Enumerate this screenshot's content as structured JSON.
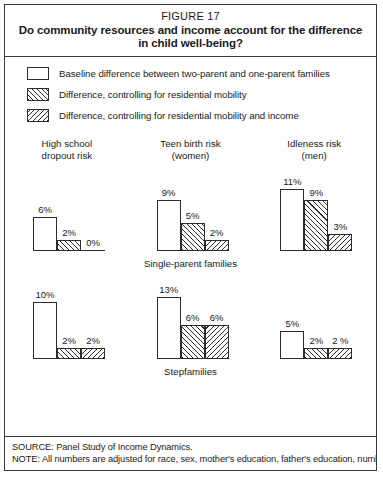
{
  "figure": {
    "number": "FIGURE 17",
    "title_line1": "Do community resources and income account for the difference",
    "title_line2": "in child well-being?"
  },
  "legend": {
    "items": [
      {
        "pattern": "plain",
        "label": "Baseline difference between two-parent and one-parent families"
      },
      {
        "pattern": "forward-hatch",
        "label": "Difference, controlling for residential mobility"
      },
      {
        "pattern": "back-hatch",
        "label": "Difference, controlling for residential mobility and income"
      }
    ]
  },
  "columns": [
    {
      "line1": "High school",
      "line2": "dropout risk"
    },
    {
      "line1": "Teen birth risk",
      "line2": "(women)"
    },
    {
      "line1": "Idleness risk",
      "line2": "(men)"
    }
  ],
  "rows": [
    {
      "group_label": "Single-parent families",
      "label_column": 1
    },
    {
      "group_label": "Stepfamilies",
      "label_column": 1
    }
  ],
  "footnotes": {
    "source": "SOURCE: Panel Study of Income Dynamics.",
    "note": "NOTE: All numbers are adjusted for race, sex, mother's education, father's education, number"
  },
  "colors": {
    "ink": "#1a1a1a",
    "border": "#3a3a3a",
    "bar_outline": "#2b2b2b",
    "background": "#ffffff"
  },
  "chart_data": {
    "type": "bar",
    "title": "Do community resources and income account for the difference in child well-being?",
    "xlabel": "",
    "ylabel": "Percentage-point difference in risk",
    "ylim": [
      0,
      13
    ],
    "grid": false,
    "legend_position": "top",
    "units": "%",
    "series": [
      {
        "name": "Baseline difference between two-parent and one-parent families",
        "pattern": "plain"
      },
      {
        "name": "Difference, controlling for residential mobility",
        "pattern": "forward-hatch"
      },
      {
        "name": "Difference, controlling for residential mobility and income",
        "pattern": "back-hatch"
      }
    ],
    "panels": [
      {
        "family_type": "Single-parent families",
        "groups": [
          {
            "category": "High school dropout risk",
            "values": [
              6,
              2,
              0
            ],
            "labels": [
              "6%",
              "2%",
              "0%"
            ]
          },
          {
            "category": "Teen birth risk (women)",
            "values": [
              9,
              5,
              2
            ],
            "labels": [
              "9%",
              "5%",
              "2%"
            ]
          },
          {
            "category": "Idleness risk (men)",
            "values": [
              11,
              9,
              3
            ],
            "labels": [
              "11%",
              "9%",
              "3%"
            ]
          }
        ]
      },
      {
        "family_type": "Stepfamilies",
        "groups": [
          {
            "category": "High school dropout risk",
            "values": [
              10,
              2,
              2
            ],
            "labels": [
              "10%",
              "2%",
              "2%"
            ]
          },
          {
            "category": "Teen birth risk (women)",
            "values": [
              13,
              6,
              6
            ],
            "labels": [
              "13%",
              "6%",
              "6%"
            ]
          },
          {
            "category": "Idleness risk (men)",
            "values": [
              5,
              2,
              2
            ],
            "labels": [
              "5%",
              "2%",
              "2 %"
            ]
          }
        ]
      }
    ]
  }
}
